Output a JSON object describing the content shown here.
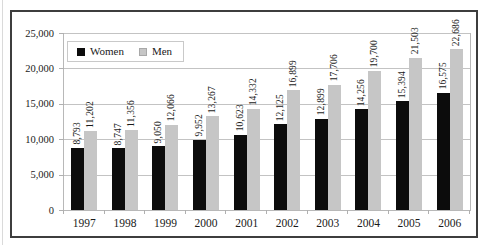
{
  "chart_data": {
    "type": "bar",
    "title": "",
    "xlabel": "",
    "ylabel": "",
    "categories": [
      "1997",
      "1998",
      "1999",
      "2000",
      "2001",
      "2002",
      "2003",
      "2004",
      "2005",
      "2006"
    ],
    "series": [
      {
        "name": "Women",
        "color": "#0c0c0c",
        "values": [
          8793,
          8747,
          9050,
          9952,
          10623,
          12125,
          12899,
          14256,
          15394,
          16575
        ]
      },
      {
        "name": "Men",
        "color": "#c6c6c6",
        "values": [
          11202,
          11356,
          12066,
          13267,
          14332,
          16899,
          17706,
          19700,
          21503,
          22686
        ]
      }
    ],
    "ylim": [
      0,
      25000
    ],
    "yticks": [
      0,
      5000,
      10000,
      15000,
      20000,
      25000
    ],
    "ytick_labels": [
      "0",
      "5,000",
      "10,000",
      "15,000",
      "20,000",
      "25,000"
    ],
    "grid": true,
    "legend_position": "top-left inside plot",
    "data_labels": "comma-formatted values rotated 90° above each bar"
  },
  "colors": {
    "frame_border": "#3d3d3d",
    "gridline": "#c3c3c3",
    "axis_line": "#b8b8b8",
    "text": "#1a1a1a",
    "background": "#ffffff"
  }
}
